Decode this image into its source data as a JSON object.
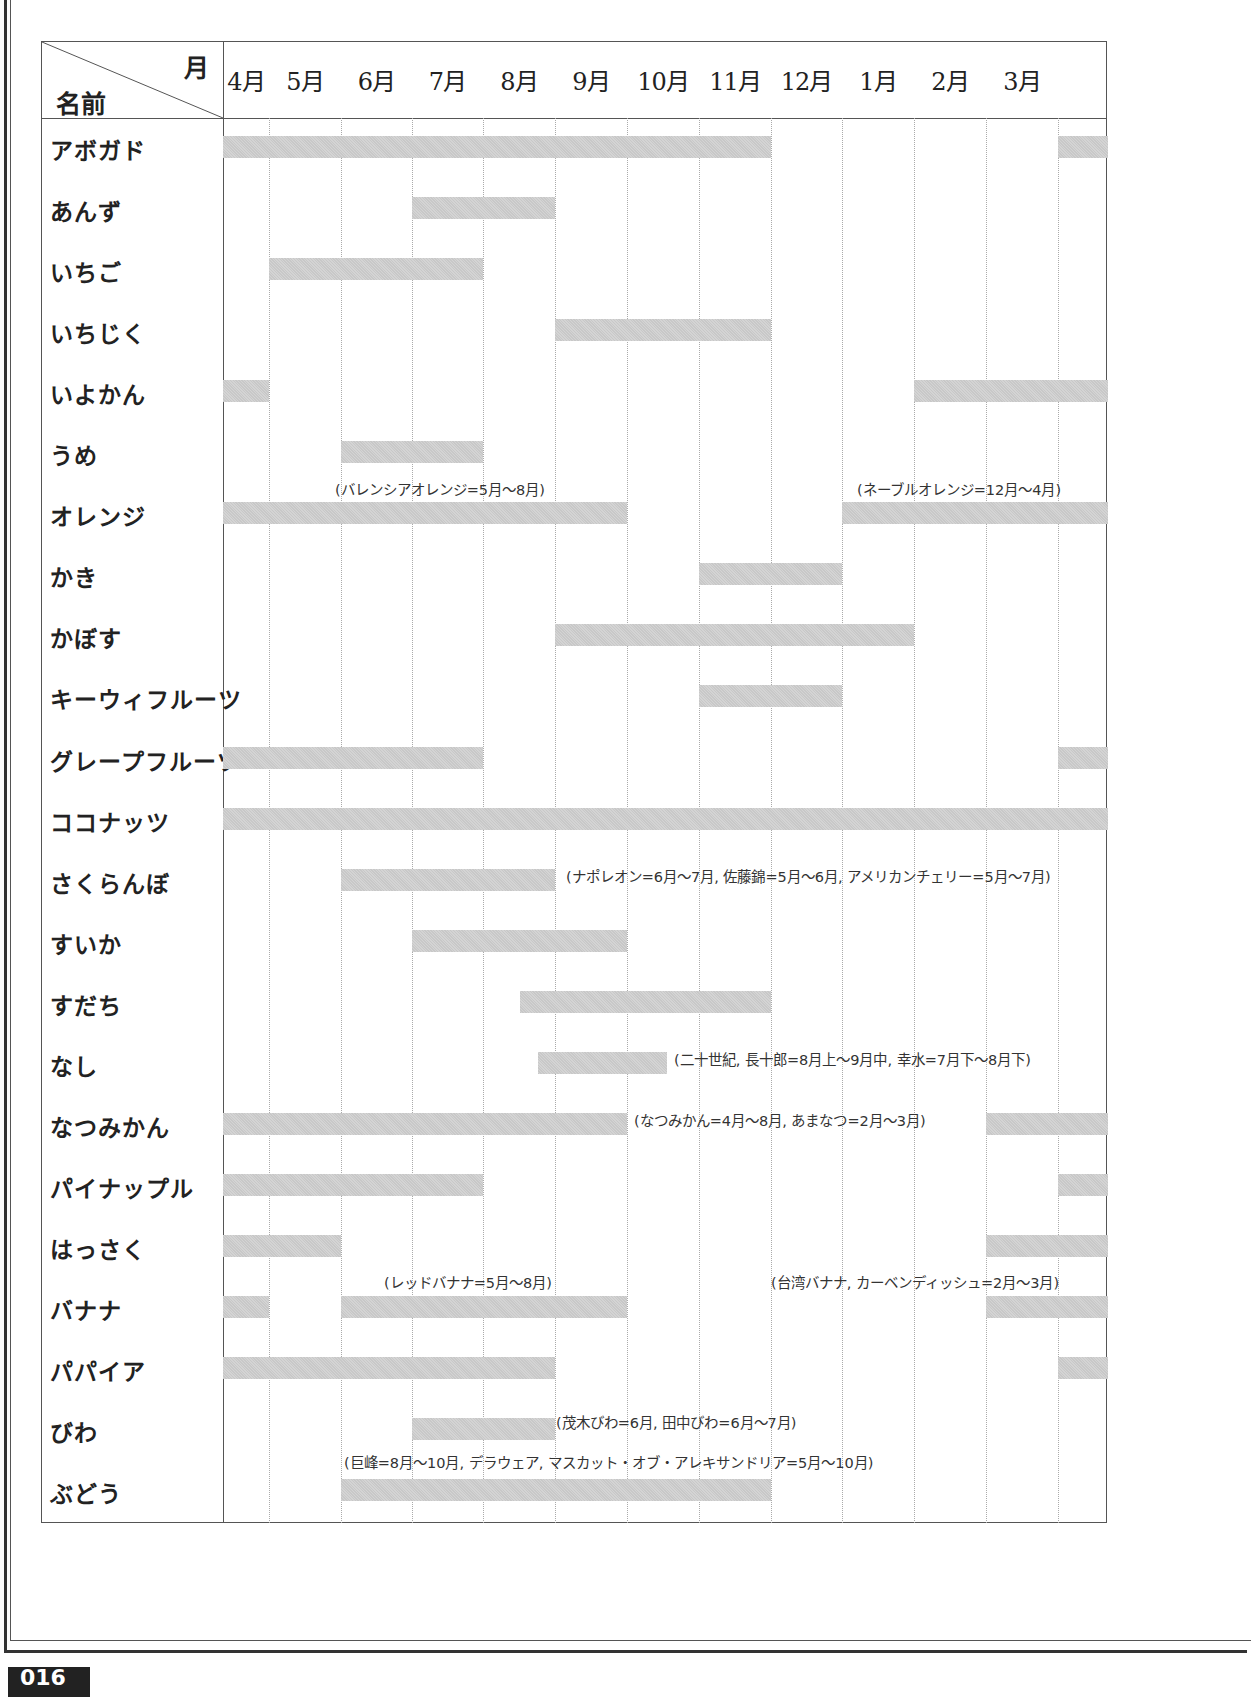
{
  "page": {
    "page_number": "016",
    "top_caption": ""
  },
  "header": {
    "corner_month": "月",
    "corner_name": "名前",
    "months": [
      "4月",
      "5月",
      "6月",
      "7月",
      "8月",
      "9月",
      "10月",
      "11月",
      "12月",
      "1月",
      "2月",
      "3月"
    ]
  },
  "chart_data": {
    "type": "table",
    "title": "",
    "subtitle": "",
    "xlabel": "月",
    "ylabel": "名前",
    "categories": [
      "4月",
      "5月",
      "6月",
      "7月",
      "8月",
      "9月",
      "10月",
      "11月",
      "12月",
      "1月",
      "2月",
      "3月"
    ],
    "grid": true,
    "legend": "none",
    "column_boundaries_px": [
      222,
      268,
      340,
      411,
      482,
      554,
      626,
      698,
      770,
      841,
      913,
      985,
      1057,
      1107
    ],
    "rows": [
      {
        "name": "アボガド",
        "bars": [
          {
            "from": "4月",
            "to": "10月",
            "x1": 222,
            "x2": 770
          },
          {
            "from": "3月",
            "to": "3月",
            "x1": 1057,
            "x2": 1107
          }
        ]
      },
      {
        "name": "あんず",
        "bars": [
          {
            "from": "6月",
            "to": "7月",
            "x1": 411,
            "x2": 554
          }
        ]
      },
      {
        "name": "いちご",
        "bars": [
          {
            "from": "5月",
            "to": "7月",
            "x1": 268,
            "x2": 482
          }
        ]
      },
      {
        "name": "いちじく",
        "bars": [
          {
            "from": "8月",
            "to": "10月",
            "x1": 554,
            "x2": 770
          }
        ]
      },
      {
        "name": "いよかん",
        "bars": [
          {
            "from": "4月",
            "to": "4月",
            "x1": 222,
            "x2": 268
          },
          {
            "from": "1月",
            "to": "3月",
            "x1": 913,
            "x2": 1107
          }
        ]
      },
      {
        "name": "うめ",
        "bars": [
          {
            "from": "5月",
            "to": "6月",
            "x1": 340,
            "x2": 482
          }
        ]
      },
      {
        "name": "オレンジ",
        "bars": [
          {
            "from": "4月",
            "to": "8月",
            "x1": 222,
            "x2": 626
          },
          {
            "from": "12月",
            "to": "3月",
            "x1": 841,
            "x2": 1107
          }
        ],
        "notes": [
          {
            "text": "(バレンシアオレンジ=5月～8月)",
            "x": 334,
            "y": 477
          },
          {
            "text": "(ネーブルオレンジ=12月～4月)",
            "x": 856,
            "y": 477
          }
        ]
      },
      {
        "name": "かき",
        "bars": [
          {
            "from": "10月",
            "to": "11月",
            "x1": 698,
            "x2": 841
          }
        ]
      },
      {
        "name": "かぼす",
        "bars": [
          {
            "from": "8月",
            "to": "12月",
            "x1": 554,
            "x2": 913
          }
        ]
      },
      {
        "name": "キーウィフルーツ",
        "bars": [
          {
            "from": "10月",
            "to": "11月",
            "x1": 698,
            "x2": 841
          }
        ]
      },
      {
        "name": "グレープフルーツ",
        "bars": [
          {
            "from": "4月",
            "to": "7月",
            "x1": 222,
            "x2": 482
          },
          {
            "from": "3月",
            "to": "3月",
            "x1": 1057,
            "x2": 1107
          }
        ]
      },
      {
        "name": "ココナッツ",
        "bars": [
          {
            "from": "4月",
            "to": "3月",
            "x1": 222,
            "x2": 1107
          }
        ]
      },
      {
        "name": "さくらんぼ",
        "bars": [
          {
            "from": "5月",
            "to": "7月",
            "x1": 340,
            "x2": 554
          }
        ],
        "notes": [
          {
            "text": "(ナポレオン=6月～7月, 佐藤錦=5月～6月, アメリカンチェリー=5月～7月)",
            "x": 565,
            "y": 864
          }
        ]
      },
      {
        "name": "すいか",
        "bars": [
          {
            "from": "6月",
            "to": "8月",
            "x1": 411,
            "x2": 626
          }
        ]
      },
      {
        "name": "すだち",
        "bars": [
          {
            "from": "7月下",
            "to": "10月",
            "x1": 519,
            "x2": 770
          }
        ]
      },
      {
        "name": "なし",
        "bars": [
          {
            "from": "7月下",
            "to": "9月中",
            "x1": 537,
            "x2": 666
          }
        ],
        "notes": [
          {
            "text": "(二十世紀, 長十郎=8月上～9月中, 幸水=7月下～8月下)",
            "x": 673,
            "y": 1047
          }
        ]
      },
      {
        "name": "なつみかん",
        "bars": [
          {
            "from": "4月",
            "to": "8月",
            "x1": 222,
            "x2": 626
          },
          {
            "from": "2月",
            "to": "3月",
            "x1": 985,
            "x2": 1107
          }
        ],
        "notes": [
          {
            "text": "(なつみかん=4月～8月, あまなつ=2月～3月)",
            "x": 633,
            "y": 1108
          }
        ]
      },
      {
        "name": "パイナップル",
        "bars": [
          {
            "from": "4月",
            "to": "7月",
            "x1": 222,
            "x2": 482
          },
          {
            "from": "3月",
            "to": "3月",
            "x1": 1057,
            "x2": 1107
          }
        ]
      },
      {
        "name": "はっさく",
        "bars": [
          {
            "from": "4月",
            "to": "5月",
            "x1": 222,
            "x2": 340
          },
          {
            "from": "2月",
            "to": "3月",
            "x1": 985,
            "x2": 1107
          }
        ]
      },
      {
        "name": "バナナ",
        "bars": [
          {
            "from": "4月",
            "to": "4月",
            "x1": 222,
            "x2": 268
          },
          {
            "from": "6月",
            "to": "8月",
            "x1": 340,
            "x2": 626
          },
          {
            "from": "2月",
            "to": "3月",
            "x1": 985,
            "x2": 1107
          }
        ],
        "notes": [
          {
            "text": "(レッドバナナ=5月～8月)",
            "x": 383,
            "y": 1270
          },
          {
            "text": "(台湾バナナ, カーベンディッシュ=2月～3月)",
            "x": 770,
            "y": 1270
          }
        ]
      },
      {
        "name": "パパイア",
        "bars": [
          {
            "from": "4月",
            "to": "8月",
            "x1": 222,
            "x2": 554
          },
          {
            "from": "3月",
            "to": "3月",
            "x1": 1057,
            "x2": 1107
          }
        ]
      },
      {
        "name": "びわ",
        "bars": [
          {
            "from": "6月",
            "to": "8月",
            "x1": 411,
            "x2": 554
          }
        ],
        "notes": [
          {
            "text": "(茂木びわ=6月, 田中びわ=6月～7月)",
            "x": 555,
            "y": 1410
          }
        ]
      },
      {
        "name": "ぶどう",
        "bars": [
          {
            "from": "6月",
            "to": "10月",
            "x1": 340,
            "x2": 770
          }
        ],
        "notes": [
          {
            "text": "(巨峰=8月～10月, デラウェア, マスカット・オブ・アレキサンドリア=5月～10月)",
            "x": 343,
            "y": 1450
          }
        ]
      }
    ]
  }
}
